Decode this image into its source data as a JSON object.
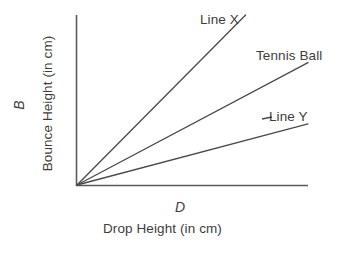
{
  "chart_data": {
    "type": "line",
    "title": "",
    "subtitle": "",
    "xlabel": "Drop Height (in cm)",
    "ylabel": "Bounce Height (in cm)",
    "x_variable": "D",
    "y_variable": "B",
    "grid": false,
    "legend_position": "inline-end-of-line",
    "axis_ticks": false,
    "xlim": [
      0,
      100
    ],
    "ylim": [
      0,
      100
    ],
    "series": [
      {
        "name": "Line X",
        "label": "Line X",
        "slope": 1.37,
        "x": [
          0,
          100
        ],
        "values": [
          0,
          137
        ],
        "color": "#4a4a4a"
      },
      {
        "name": "Tennis Ball",
        "label": "Tennis Ball",
        "slope": 0.72,
        "x": [
          0,
          100
        ],
        "values": [
          0,
          72
        ],
        "color": "#4a4a4a"
      },
      {
        "name": "Line Y",
        "label": "Line Y",
        "slope": 0.36,
        "x": [
          0,
          100
        ],
        "values": [
          0,
          36
        ],
        "color": "#4a4a4a"
      }
    ]
  },
  "axes": {
    "y_variable_symbol": "B",
    "y_title": "Bounce Height (in cm)",
    "x_variable_symbol": "D",
    "x_title": "Drop Height (in cm)"
  },
  "labels": {
    "line_x": "Line X",
    "tennis_ball": "Tennis Ball",
    "line_y": "Line Y"
  },
  "colors": {
    "background": "#ffffff",
    "axis": "#5a5a5a",
    "line": "#4a4a4a",
    "text": "#3d3d3d"
  }
}
